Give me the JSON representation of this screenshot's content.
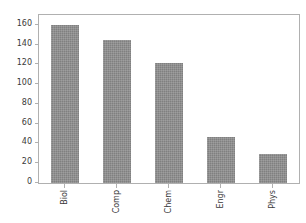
{
  "chart_data": {
    "type": "bar",
    "title": "",
    "xlabel": "",
    "ylabel": "",
    "categories": [
      "Biol",
      "Comp",
      "Chem",
      "Engr",
      "Phys"
    ],
    "values": [
      160,
      145,
      121,
      47,
      29
    ],
    "ylim": [
      0,
      170
    ],
    "yticks": [
      0,
      20,
      40,
      60,
      80,
      100,
      120,
      140,
      160
    ],
    "ytick_labels": [
      "0",
      "20",
      "40",
      "60",
      "80",
      "100",
      "120",
      "140",
      "160"
    ],
    "grid": false,
    "legend": null,
    "bar_color": "#808080",
    "bar_hatch": "dotted",
    "spine_color": "#b0b0b0",
    "tick_label_color": "#3a3a3a",
    "xtick_label_rotation": 90,
    "background": "#ffffff"
  }
}
